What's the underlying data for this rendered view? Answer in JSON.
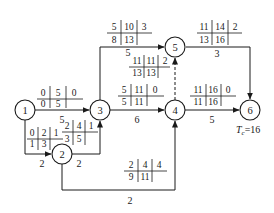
{
  "diagram": {
    "type": "activity-on-arrow network (CPM time parameters)",
    "total_duration_label": "T",
    "total_duration_subscript": "c",
    "total_duration_value": "=16",
    "nodes": [
      {
        "id": "1",
        "label": "1"
      },
      {
        "id": "2",
        "label": "2"
      },
      {
        "id": "3",
        "label": "3"
      },
      {
        "id": "4",
        "label": "4"
      },
      {
        "id": "5",
        "label": "5"
      },
      {
        "id": "6",
        "label": "6"
      }
    ],
    "activities": [
      {
        "from": "1",
        "to": "3",
        "duration": "5",
        "ES": "0",
        "EF": "5",
        "TF": "0",
        "LS": "0",
        "LF": "5",
        "FF": ""
      },
      {
        "from": "1",
        "to": "2",
        "duration": "2",
        "ES": "0",
        "EF": "2",
        "TF": "1",
        "LS": "1",
        "LF": "3",
        "FF": ""
      },
      {
        "from": "2",
        "to": "3",
        "duration": "2",
        "ES": "2",
        "EF": "4",
        "TF": "1",
        "LS": "3",
        "LF": "5",
        "FF": ""
      },
      {
        "from": "2",
        "to": "4",
        "duration": "2",
        "ES": "2",
        "EF": "4",
        "TF": "4",
        "LS": "9",
        "LF": "11",
        "FF": ""
      },
      {
        "from": "3",
        "to": "5",
        "duration": "5",
        "ES": "5",
        "EF": "10",
        "TF": "3",
        "LS": "8",
        "LF": "13",
        "FF": ""
      },
      {
        "from": "3",
        "to": "4",
        "duration": "6",
        "ES": "5",
        "EF": "11",
        "TF": "0",
        "LS": "5",
        "LF": "11",
        "FF": ""
      },
      {
        "from": "4",
        "to": "5",
        "duration": "",
        "dummy": true,
        "ES": "11",
        "EF": "11",
        "TF": "2",
        "LS": "13",
        "LF": "13",
        "FF": ""
      },
      {
        "from": "4",
        "to": "6",
        "duration": "5",
        "ES": "11",
        "EF": "16",
        "TF": "0",
        "LS": "11",
        "LF": "16",
        "FF": ""
      },
      {
        "from": "5",
        "to": "6",
        "duration": "3",
        "ES": "11",
        "EF": "14",
        "TF": "2",
        "LS": "13",
        "LF": "16",
        "FF": ""
      }
    ]
  },
  "colors": {
    "line": "#1a1a1a",
    "background": "#ffffff"
  }
}
